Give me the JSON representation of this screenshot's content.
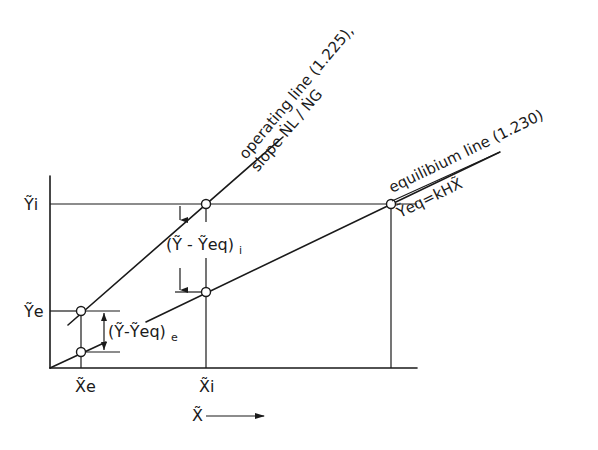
{
  "diagram": {
    "type": "absorption operating/equilibrium line diagram",
    "axes": {
      "x_label": "X̃",
      "x_arrow": "→",
      "x_ticks": [
        {
          "label": "X̃e",
          "pos": 81
        },
        {
          "label": "X̃i",
          "pos": 206
        }
      ],
      "y_ticks": [
        {
          "label": "Ỹi",
          "pos": 204
        },
        {
          "label": "Ỹe",
          "pos": 311
        }
      ]
    },
    "lines": {
      "operating": {
        "label": "operating line (1.225),",
        "slope_label": "slope ṄL / ṄG"
      },
      "equilibrium": {
        "label": "equilibium line (1.230)",
        "equation": "Ỹeq=kHX̃"
      }
    },
    "differences": {
      "inlet": "(Ỹ - Ỹeq)",
      "inlet_sub": "i",
      "outlet": "(Ỹ-Ỹeq)",
      "outlet_sub": "e"
    },
    "colors": {
      "ink": "#1a1a1a",
      "background": "#ffffff"
    }
  }
}
